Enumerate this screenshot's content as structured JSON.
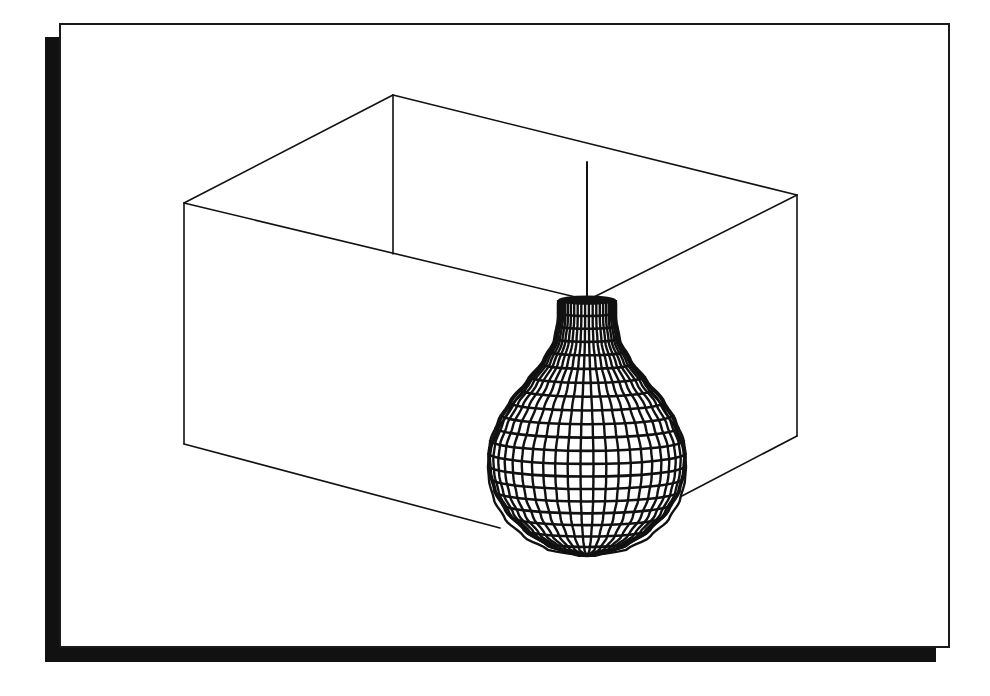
{
  "figure": {
    "colors": {
      "background": "#ffffff",
      "ink": "#111111",
      "shadow": "#111111"
    },
    "frame": {
      "left": 59,
      "top": 23,
      "right": 950,
      "bottom": 648,
      "shadow_offset": 14
    },
    "box": {
      "top_face": {
        "left": [
          184,
          203
        ],
        "back": [
          393,
          95
        ],
        "right": [
          797,
          195
        ],
        "front": [
          588,
          300
        ]
      },
      "back_inner_bottom": [
        393,
        254
      ],
      "bottom_left": [
        184,
        444
      ],
      "bottom_right": [
        797,
        436
      ],
      "bottom_front_left_edge_end": [
        500,
        528
      ],
      "bottom_front_right_edge_end": [
        680,
        497
      ]
    },
    "stem": {
      "top": [
        587,
        162
      ],
      "bottom": [
        587,
        298
      ]
    },
    "vase": {
      "center_x": 587,
      "rings": 20,
      "meridians": 24,
      "ellipse_ratio": 0.11,
      "profile": [
        [
          300,
          29
        ],
        [
          318,
          29
        ],
        [
          340,
          33
        ],
        [
          360,
          44
        ],
        [
          380,
          60
        ],
        [
          400,
          77
        ],
        [
          420,
          89
        ],
        [
          440,
          97
        ],
        [
          455,
          99
        ],
        [
          470,
          98
        ],
        [
          490,
          93
        ],
        [
          510,
          82
        ],
        [
          530,
          63
        ],
        [
          545,
          40
        ],
        [
          555,
          8
        ]
      ]
    }
  }
}
